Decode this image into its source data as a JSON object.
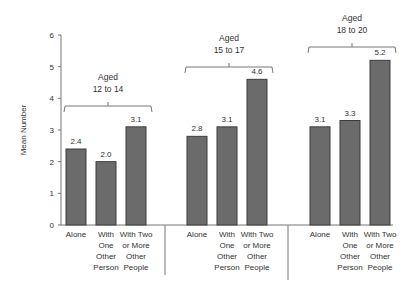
{
  "chart_data": {
    "type": "bar",
    "title": "",
    "xlabel": "",
    "ylabel": "Mean Number",
    "ylim": [
      0,
      6
    ],
    "yticks": [
      0,
      1,
      2,
      3,
      4,
      5,
      6
    ],
    "grid": false,
    "legend": null,
    "categories": [
      "Alone",
      "With One Other Person",
      "With Two or More Other People"
    ],
    "category_lines": [
      [
        "Alone"
      ],
      [
        "With",
        "One",
        "Other",
        "Person"
      ],
      [
        "With Two",
        "or More",
        "Other",
        "People"
      ]
    ],
    "groups": [
      {
        "label_lines": [
          "Aged",
          "12 to 14"
        ],
        "label": "Aged 12 to 14",
        "values": [
          2.4,
          2.0,
          3.1
        ]
      },
      {
        "label_lines": [
          "Aged",
          "15 to 17"
        ],
        "label": "Aged 15 to 17",
        "values": [
          2.8,
          3.1,
          4.6
        ]
      },
      {
        "label_lines": [
          "Aged",
          "18 to 20"
        ],
        "label": "Aged 18 to 20",
        "values": [
          3.1,
          3.3,
          5.2
        ]
      }
    ],
    "series": [
      {
        "name": "Aged 12 to 14",
        "values": [
          2.4,
          2.0,
          3.1
        ]
      },
      {
        "name": "Aged 15 to 17",
        "values": [
          2.8,
          3.1,
          4.6
        ]
      },
      {
        "name": "Aged 18 to 20",
        "values": [
          3.1,
          3.3,
          5.2
        ]
      }
    ],
    "value_labels": [
      [
        "2.4",
        "2.0",
        "3.1"
      ],
      [
        "2.8",
        "3.1",
        "4.6"
      ],
      [
        "3.1",
        "3.3",
        "5.2"
      ]
    ],
    "colors": {
      "bar_fill": "#6b6b6b",
      "bar_stroke": "#3c3c3c",
      "axis": "#777777",
      "text": "#333333"
    }
  }
}
